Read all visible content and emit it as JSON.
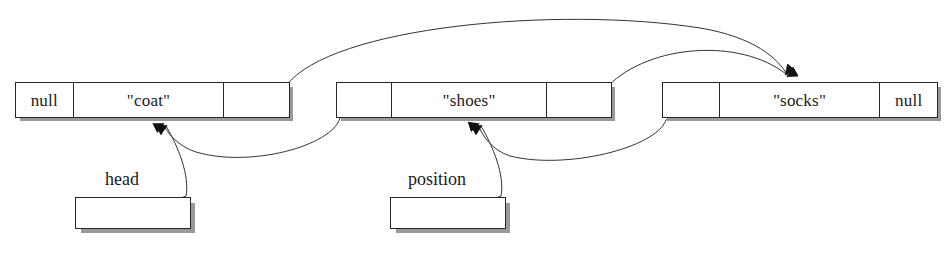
{
  "diagram": {
    "colors": {
      "background": "#ffffff",
      "stroke": "#262626",
      "shadow": "#9a9a9a",
      "text": "#1a1a1a"
    },
    "nodes": [
      {
        "id": "node-coat",
        "cells": [
          {
            "kind": "value",
            "text": "null"
          },
          {
            "kind": "value",
            "text": "\"coat\""
          },
          {
            "kind": "pointer",
            "text": ""
          }
        ]
      },
      {
        "id": "node-shoes",
        "cells": [
          {
            "kind": "pointer",
            "text": ""
          },
          {
            "kind": "value",
            "text": "\"shoes\""
          },
          {
            "kind": "pointer",
            "text": ""
          }
        ]
      },
      {
        "id": "node-socks",
        "cells": [
          {
            "kind": "pointer",
            "text": ""
          },
          {
            "kind": "value",
            "text": "\"socks\""
          },
          {
            "kind": "value",
            "text": "null"
          }
        ]
      }
    ],
    "variables": [
      {
        "id": "var-head",
        "label": "head"
      },
      {
        "id": "var-position",
        "label": "position"
      }
    ]
  }
}
